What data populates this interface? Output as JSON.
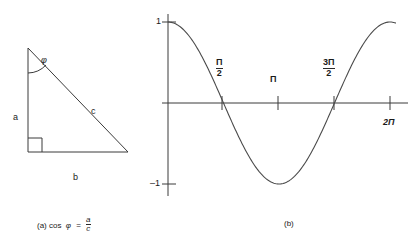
{
  "figure": {
    "panel_a": {
      "name": "right-triangle-cosine-definition",
      "side_vertical_label": "a",
      "side_hypotenuse_label": "c",
      "side_horizontal_label": "b",
      "angle_label": "φ",
      "right_angle_marker": "right-angle",
      "caption_prefix": "(a) cos",
      "caption_symbol": "φ",
      "caption_equals": "=",
      "caption_fraction_numerator": "a",
      "caption_fraction_denominator": "c"
    },
    "panel_b": {
      "name": "cosine-wave-plot",
      "caption": "(b)",
      "y_axis_top_label": "1",
      "y_axis_bottom_label": "–1",
      "x_tick_labels": [
        {
          "text_numerator": "Π",
          "text_denominator": "2",
          "display": "Π/2"
        },
        {
          "text": "Π"
        },
        {
          "text_numerator": "3Π",
          "text_denominator": "2",
          "display": "3Π/2"
        },
        {
          "text": "2Π"
        }
      ]
    }
  },
  "chart_data": {
    "type": "line",
    "title": "",
    "xlabel": "",
    "ylabel": "",
    "xlim": [
      0,
      6.4
    ],
    "ylim": [
      -1,
      1
    ],
    "grid": false,
    "legend": "none",
    "series": [
      {
        "name": "cos",
        "x": [
          0,
          0.3927,
          0.7854,
          1.1781,
          1.5708,
          1.9635,
          2.3562,
          2.7489,
          3.1416,
          3.5343,
          3.927,
          4.3197,
          4.7124,
          5.1051,
          5.4978,
          5.8905,
          6.2832
        ],
        "y": [
          1.0,
          0.924,
          0.707,
          0.383,
          0.0,
          -0.383,
          -0.707,
          -0.924,
          -1.0,
          -0.924,
          -0.707,
          -0.383,
          0.0,
          0.383,
          0.707,
          0.924,
          1.0
        ]
      }
    ],
    "x_ticks": [
      {
        "value": 1.5708,
        "label": "Π/2"
      },
      {
        "value": 3.1416,
        "label": "Π"
      },
      {
        "value": 4.7124,
        "label": "3Π/2"
      },
      {
        "value": 6.2832,
        "label": "2Π"
      }
    ],
    "y_ticks": [
      {
        "value": 1,
        "label": "1"
      },
      {
        "value": -1,
        "label": "–1"
      }
    ],
    "colors": {
      "line": "#3a3a3a",
      "axis": "#3a3a3a",
      "background": "#ffffff"
    }
  }
}
